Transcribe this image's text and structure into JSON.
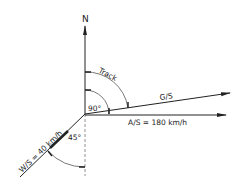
{
  "diagram": {
    "labels": {
      "north": "N",
      "track": "Track",
      "ground_speed": "G/S",
      "airspeed": "A/S = 180 km/h",
      "wind_speed": "W/S = 40 km/h",
      "angle_heading": "90°",
      "angle_wind": "45°"
    },
    "vectors": [
      {
        "name": "North",
        "direction_deg": 0
      },
      {
        "name": "A/S",
        "magnitude_kmh": 180,
        "direction_deg": 90
      },
      {
        "name": "W/S",
        "magnitude_kmh": 40,
        "direction_deg": 225
      },
      {
        "name": "G/S",
        "direction_deg": "track"
      }
    ],
    "colors": {
      "line": "#222222",
      "background": "#ffffff"
    }
  }
}
